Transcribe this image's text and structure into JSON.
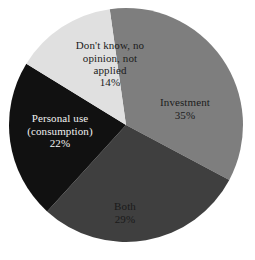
{
  "chart_data": {
    "type": "pie",
    "title": "",
    "subtitle": "",
    "xlabel": "",
    "ylabel": "",
    "legend_position": "none",
    "grid": false,
    "labels_inside": true,
    "total_percent": 100,
    "categories": [
      "Investment",
      "Both",
      "Personal use (consumption)",
      "Don't know, no opinion, not applied"
    ],
    "values": [
      35,
      29,
      22,
      14
    ],
    "colors": [
      "#7e7e7e",
      "#3f3f3f",
      "#111111",
      "#e0e0e0"
    ],
    "slices": [
      {
        "name": "Investment",
        "label": "Investment",
        "value": 35,
        "percent_text": "35%",
        "color": "#7e7e7e",
        "text_color": "#1c1c1c"
      },
      {
        "name": "Both",
        "label": "Both",
        "value": 29,
        "percent_text": "29%",
        "color": "#3f3f3f",
        "text_color": "#1a1a1a"
      },
      {
        "name": "Personal use (consumption)",
        "label": "Personal use\n(consumption)",
        "value": 22,
        "percent_text": "22%",
        "color": "#111111",
        "text_color": "#f2f2f2"
      },
      {
        "name": "Don't know, no opinion, not applied",
        "label": "Don't know, no\nopinion, not\napplied",
        "value": 14,
        "percent_text": "14%",
        "color": "#e0e0e0",
        "text_color": "#1c1c1c"
      }
    ]
  },
  "geometry": {
    "center_x": 126,
    "center_y": 125,
    "radius": 117,
    "start_angle_deg": -8
  },
  "background_color": "#ffffff"
}
